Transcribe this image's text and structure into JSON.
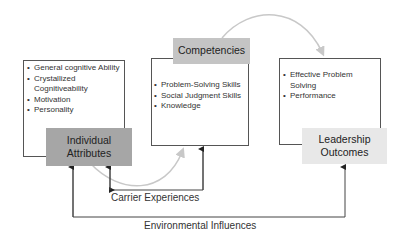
{
  "diagram": {
    "attributes": {
      "title": "Individual Attributes",
      "items": [
        "General cognitive Ability",
        "Crystallized Cognitiveability",
        "Motivation",
        "Personality"
      ]
    },
    "competencies": {
      "title": "Competencies",
      "items": [
        "Problem-Solving Skills",
        "Social Judgment Skills",
        "Knowledge"
      ]
    },
    "outcomes": {
      "title": "Leadership Outcomes",
      "items": [
        "Effective Problem Solving",
        "Performance"
      ]
    },
    "carrier_label": "Carrier Experiences",
    "environment_label": "Environmental Influences",
    "colors": {
      "attributes_fill": "#a6a6a6",
      "competencies_fill": "#c4c4c4",
      "outcomes_fill": "#e8e8e8",
      "curve": "#c8c8c8",
      "line": "#444444"
    }
  }
}
